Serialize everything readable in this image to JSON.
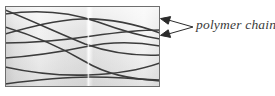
{
  "figure": {
    "kind": "schematic-diagram",
    "background_color": "#ffffff"
  },
  "specimen_box": {
    "name": "polymer-specimen-box",
    "x": 5,
    "y": 6,
    "width": 155,
    "height": 81,
    "border_color": "#6e6e6e",
    "border_width": 1,
    "fill_description": "light grey horizontal gradient with a pale vertical highlight band near the centre",
    "fill_colors": [
      "#d6d6d6",
      "#f0f0f0",
      "#e6e6e6",
      "#fbfbfb",
      "#e0e0e0",
      "#f4f4f4"
    ],
    "highlight_band_x": 88,
    "highlight_band_color": "#fdfdfd"
  },
  "chains": {
    "name": "polymer-chains",
    "stroke_color": "#3c3c3c",
    "stroke_width": 1.6,
    "count": 8,
    "paths": [
      "M 5,14 C 40,9 70,12 98,22 C 120,30 140,36 160,39",
      "M 5,10 C 35,22 60,34 85,44 C 110,53 135,56 160,55",
      "M 5,34 C 30,27 55,20 82,19 C 110,18 138,25 160,33",
      "M 5,43 C 35,43 65,40 92,36 C 120,32 142,30 160,30",
      "M 5,27 C 35,36 62,48 84,61 C 104,73 130,80 160,80",
      "M 5,58 C 35,56 60,52 84,47 C 112,41 138,42 160,46",
      "M 5,67 C 32,73 58,76 88,75 C 118,74 140,70 160,63",
      "M 5,84 C 35,80 60,77 90,77 C 120,77 142,79 160,81"
    ]
  },
  "annotation": {
    "name": "polymer-chains-annotation",
    "label": "polymer chains",
    "text_color": "#3a3a3a",
    "leader": {
      "origin_x": 193,
      "origin_y": 27,
      "arrow_color": "#2b2b2b",
      "arrows": [
        {
          "name": "upper-arrow",
          "tip_x": 161,
          "tip_y": 19
        },
        {
          "name": "lower-arrow",
          "tip_x": 161,
          "tip_y": 35
        }
      ]
    }
  }
}
